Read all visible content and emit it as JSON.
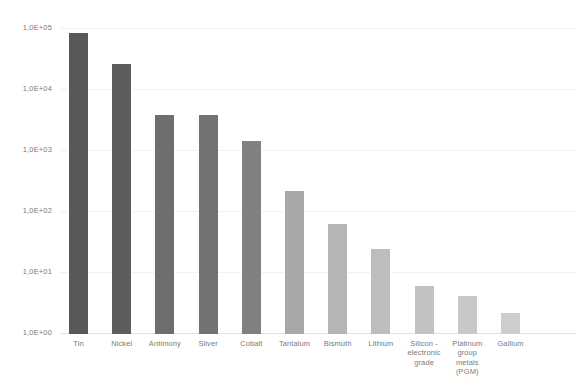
{
  "chart_data": {
    "type": "bar",
    "title": "",
    "subtitle": "",
    "xlabel": "",
    "ylabel": "",
    "scale": "log",
    "ylim": [
      1,
      100000
    ],
    "grid": true,
    "legend": "none",
    "decimal_separator": "comma",
    "y_ticks": [
      {
        "label": "1,0E+05",
        "value": 100000
      },
      {
        "label": "1,0E+04",
        "value": 10000
      },
      {
        "label": "1,0E+03",
        "value": 1000
      },
      {
        "label": "1,0E+02",
        "value": 100
      },
      {
        "label": "1,0E+01",
        "value": 10
      },
      {
        "label": "1,0E+00",
        "value": 1
      }
    ],
    "categories": [
      "Tin",
      "Nickel",
      "Antimony",
      "Silver",
      "Cobalt",
      "Tantalum",
      "Bismuth",
      "Lithium",
      "Silicon - electronic grade",
      "Platinum group metals (PGM)",
      "Gallium"
    ],
    "category_label_lines": [
      [
        "Tin"
      ],
      [
        "Nickel"
      ],
      [
        "Antimony"
      ],
      [
        "Silver"
      ],
      [
        "Cobalt"
      ],
      [
        "Tantalum"
      ],
      [
        "Bismuth"
      ],
      [
        "Lithium"
      ],
      [
        "Silicon -",
        "electronic",
        "grade"
      ],
      [
        "Platinum",
        "group",
        "metals",
        "(PGM)"
      ],
      [
        "Gallium"
      ]
    ],
    "values": [
      83000,
      26000,
      3700,
      3700,
      1400,
      210,
      62,
      24,
      6.0,
      4.0,
      2.1
    ],
    "bar_colors": [
      "#595959",
      "#5d5d5d",
      "#6e6e6e",
      "#737373",
      "#808080",
      "#a8a8a8",
      "#b5b5b5",
      "#bdbdbd",
      "#c2c2c2",
      "#c8c8c8",
      "#cdcdcd"
    ]
  },
  "colors": {
    "background": "#ffffff",
    "gridline": "#f2f2f2",
    "axis": "#e3e3e3",
    "tick_text": "#7a7a7a"
  }
}
